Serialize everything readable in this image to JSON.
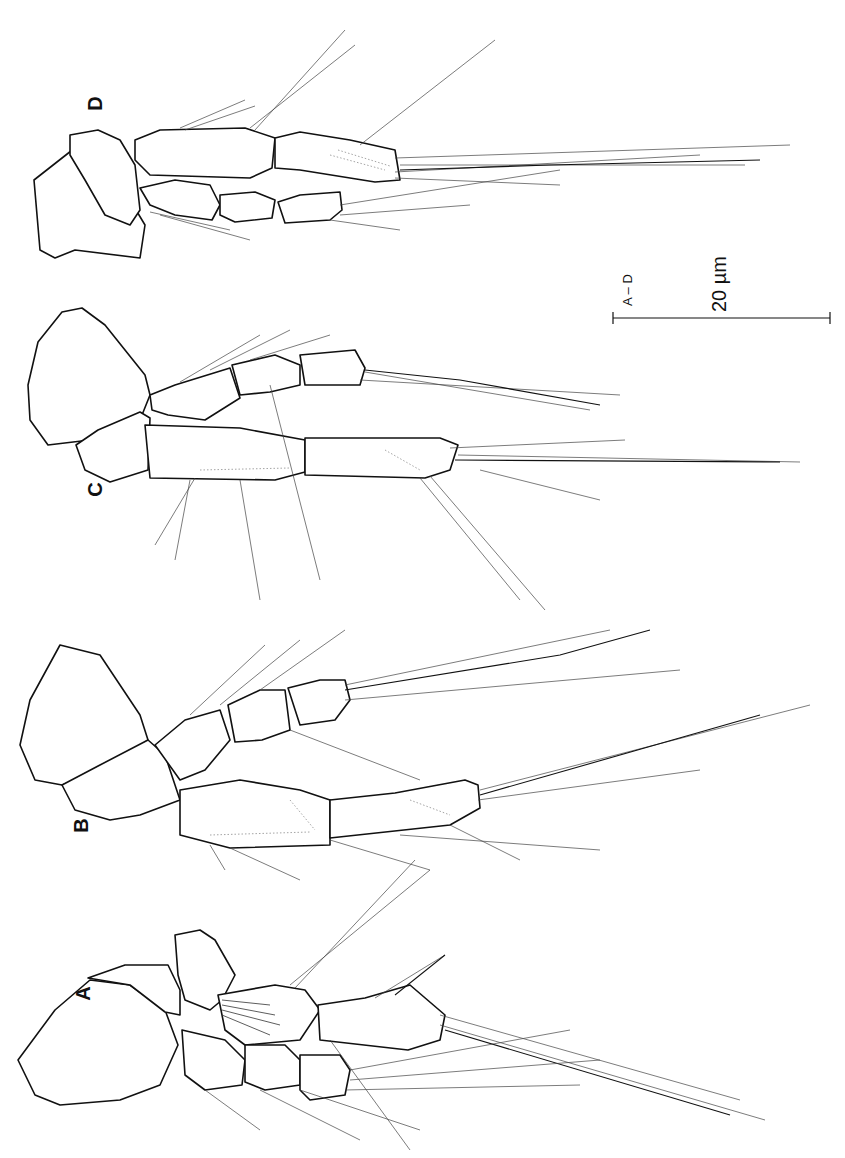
{
  "figure": {
    "panels": [
      {
        "id": "A",
        "label": "A"
      },
      {
        "id": "B",
        "label": "B"
      },
      {
        "id": "C",
        "label": "C"
      },
      {
        "id": "D",
        "label": "D"
      }
    ],
    "scale_bar": {
      "applies_to": "A – D",
      "value_label": "20 µm",
      "value": 20,
      "unit": "µm"
    },
    "colors": {
      "background": "#ffffff",
      "ink": "#111111"
    }
  }
}
